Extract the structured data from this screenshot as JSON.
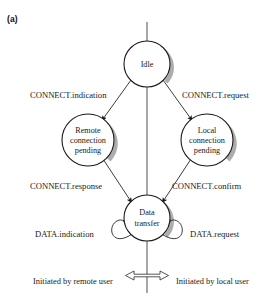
{
  "figure": {
    "panel_label": "(a)",
    "kind": "state-transition-diagram"
  },
  "nodes": [
    {
      "id": "idle",
      "lines": [
        "Idle"
      ],
      "cx": 147,
      "cy": 64,
      "r": 23
    },
    {
      "id": "remote",
      "lines": [
        "Remote",
        "connection",
        "pending"
      ],
      "cx": 88,
      "cy": 140,
      "r": 26
    },
    {
      "id": "local",
      "lines": [
        "Local",
        "connection",
        "pending"
      ],
      "cx": 207,
      "cy": 140,
      "r": 26
    },
    {
      "id": "data-transfer",
      "lines": [
        "Data",
        "transfer"
      ],
      "cx": 147,
      "cy": 218,
      "r": 23
    }
  ],
  "edges": [
    {
      "id": "connect-indication",
      "label": "CONNECT.indication",
      "from": "idle",
      "to": "remote"
    },
    {
      "id": "connect-request",
      "label": "CONNECT.request",
      "from": "idle",
      "to": "local"
    },
    {
      "id": "connect-response",
      "label": "CONNECT.response",
      "from": "remote",
      "to": "data-transfer"
    },
    {
      "id": "connect-confirm",
      "label": "CONNECT.confirm",
      "from": "local",
      "to": "data-transfer"
    },
    {
      "id": "data-indication",
      "label": "DATA.indication",
      "from": "data-transfer",
      "to": "data-transfer"
    },
    {
      "id": "data-request",
      "label": "DATA.request",
      "from": "data-transfer",
      "to": "data-transfer"
    }
  ],
  "caption": {
    "left": "Initiated by remote user",
    "right": "Initiated by local user",
    "separator_icon": "double-headed-arrow-icon"
  }
}
